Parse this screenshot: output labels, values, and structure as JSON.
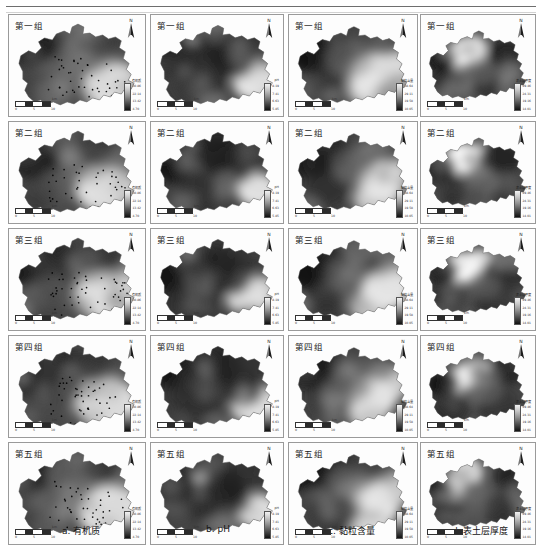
{
  "figure": {
    "title_rule": true,
    "rows": 5,
    "cols": 4
  },
  "row_labels": [
    "第一组",
    "第二组",
    "第三组",
    "第四组",
    "第五组"
  ],
  "column_captions": [
    {
      "key": "a",
      "label": "a. 有机质"
    },
    {
      "key": "b",
      "label": "b. pH"
    },
    {
      "key": "c",
      "label": "c. 黏粒含量"
    },
    {
      "key": "d",
      "label": "d. 表土层厚度"
    }
  ],
  "map_elements": {
    "north_letter": "N",
    "north_arrow_icon": "north-arrow-icon",
    "scale_ticks": [
      "0",
      "5",
      "10"
    ],
    "scale_unit": "km"
  },
  "legends": [
    {
      "column": "a",
      "title": "有机质",
      "ticks": [
        "30.86",
        "22.14",
        "13.42",
        "4.70"
      ]
    },
    {
      "column": "b",
      "title": "pH",
      "ticks": [
        "8.19",
        "7.41",
        "6.63",
        "5.85"
      ]
    },
    {
      "column": "c",
      "title": "黏粒含量",
      "ticks": [
        "38.64",
        "29.11",
        "19.58",
        "10.05"
      ]
    },
    {
      "column": "d",
      "title": "表土层厚度",
      "ticks": [
        "29.46",
        "24.31",
        "19.16",
        "14.01"
      ]
    }
  ],
  "chart_data": {
    "type": "heatmap",
    "row_categories": [
      "第一组",
      "第二组",
      "第三组",
      "第四组",
      "第五组"
    ],
    "col_categories": [
      "有机质",
      "pH",
      "黏粒含量",
      "表土层厚度"
    ],
    "colormap": "grayscale-dark-to-light",
    "grid": false,
    "legend_position": "panel-bottom-right",
    "panels": [
      {
        "row": "第一组",
        "col": "a. 有机质",
        "sample_points": 52,
        "value_min": 4.7,
        "value_max": 30.86
      },
      {
        "row": "第一组",
        "col": "b. pH",
        "sample_points": 0,
        "value_min": 5.85,
        "value_max": 8.19
      },
      {
        "row": "第一组",
        "col": "c. 黏粒含量",
        "sample_points": 0,
        "value_min": 10.05,
        "value_max": 38.64
      },
      {
        "row": "第一组",
        "col": "d. 表土层厚度",
        "sample_points": 0,
        "value_min": 14.01,
        "value_max": 29.46
      },
      {
        "row": "第二组",
        "col": "a. 有机质",
        "sample_points": 52,
        "value_min": 4.7,
        "value_max": 30.86
      },
      {
        "row": "第二组",
        "col": "b. pH",
        "sample_points": 0,
        "value_min": 5.85,
        "value_max": 8.19
      },
      {
        "row": "第二组",
        "col": "c. 黏粒含量",
        "sample_points": 0,
        "value_min": 10.05,
        "value_max": 38.64
      },
      {
        "row": "第二组",
        "col": "d. 表土层厚度",
        "sample_points": 0,
        "value_min": 14.01,
        "value_max": 29.46
      },
      {
        "row": "第三组",
        "col": "a. 有机质",
        "sample_points": 52,
        "value_min": 4.7,
        "value_max": 30.86
      },
      {
        "row": "第三组",
        "col": "b. pH",
        "sample_points": 0,
        "value_min": 5.85,
        "value_max": 8.19
      },
      {
        "row": "第三组",
        "col": "c. 黏粒含量",
        "sample_points": 0,
        "value_min": 10.05,
        "value_max": 38.64
      },
      {
        "row": "第三组",
        "col": "d. 表土层厚度",
        "sample_points": 0,
        "value_min": 14.01,
        "value_max": 29.46
      },
      {
        "row": "第四组",
        "col": "a. 有机质",
        "sample_points": 52,
        "value_min": 4.7,
        "value_max": 30.86
      },
      {
        "row": "第四组",
        "col": "b. pH",
        "sample_points": 0,
        "value_min": 5.85,
        "value_max": 8.19
      },
      {
        "row": "第四组",
        "col": "c. 黏粒含量",
        "sample_points": 0,
        "value_min": 10.05,
        "value_max": 38.64
      },
      {
        "row": "第四组",
        "col": "d. 表土层厚度",
        "sample_points": 0,
        "value_min": 14.01,
        "value_max": 29.46
      },
      {
        "row": "第五组",
        "col": "a. 有机质",
        "sample_points": 52,
        "value_min": 4.7,
        "value_max": 30.86
      },
      {
        "row": "第五组",
        "col": "b. pH",
        "sample_points": 0,
        "value_min": 5.85,
        "value_max": 8.19
      },
      {
        "row": "第五组",
        "col": "c. 黏粒含量",
        "sample_points": 0,
        "value_min": 10.05,
        "value_max": 38.64
      },
      {
        "row": "第五组",
        "col": "d. 表土层厚度",
        "sample_points": 0,
        "value_min": 14.01,
        "value_max": 29.46
      }
    ]
  }
}
